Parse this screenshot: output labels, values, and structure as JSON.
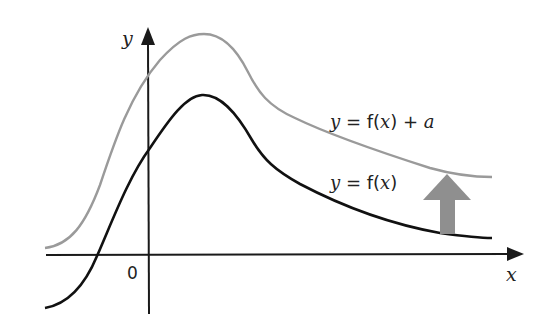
{
  "diagram": {
    "axes": {
      "x_label": "x",
      "y_label": "y",
      "origin_label": "0",
      "axis_color": "#1a1a1a"
    },
    "curves": [
      {
        "id": "original",
        "label_parts": [
          "y",
          " = f(",
          "x",
          ")"
        ],
        "label_text": "y = f(x)",
        "color": "#111111"
      },
      {
        "id": "translated",
        "label_parts": [
          "y",
          " = f(",
          "x",
          ") + ",
          "a"
        ],
        "label_text": "y = f(x) + a",
        "color": "#9a9a9a"
      }
    ],
    "translation_arrow": {
      "direction": "up",
      "meaning": "shift by a",
      "color": "#8f8f8f"
    }
  }
}
